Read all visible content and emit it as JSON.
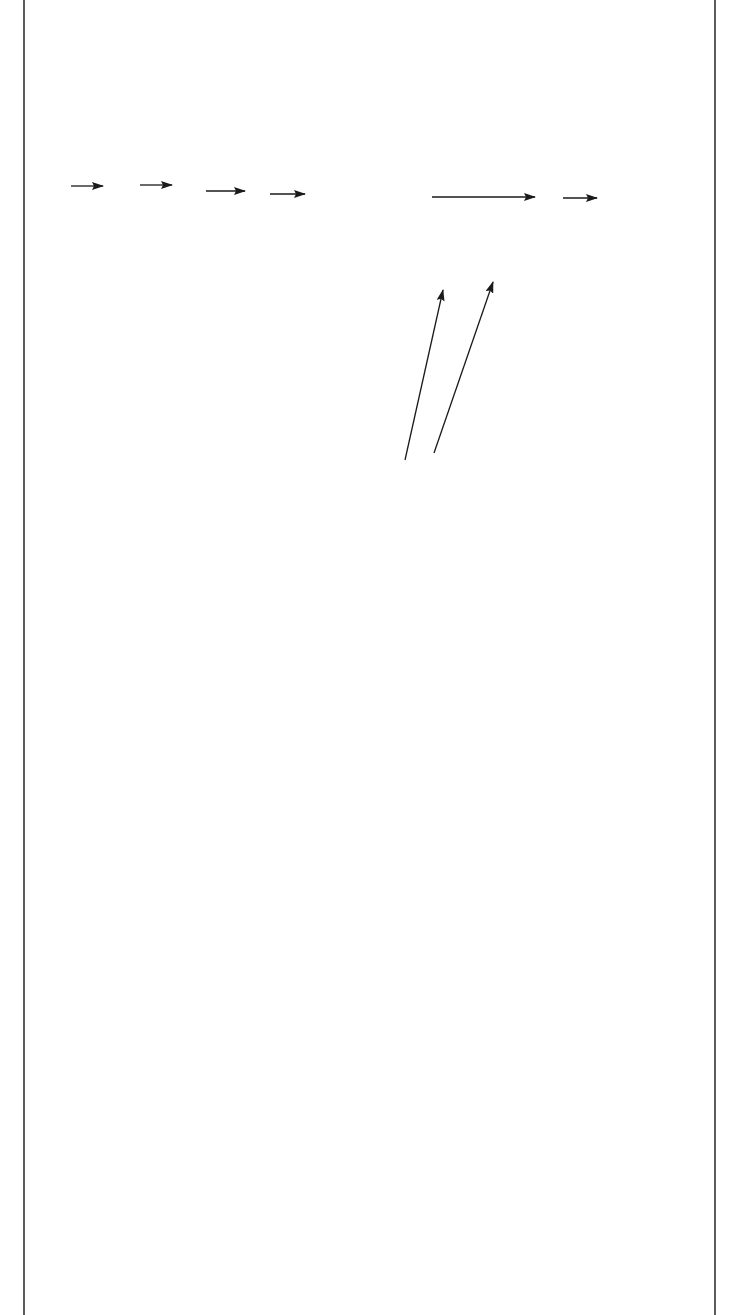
{
  "diagram": {
    "type": "flowchart",
    "orientation": "rotated-90-ccw",
    "nodes": {
      "national_party_congress": "National Party Congress",
      "party_chairman": "Party Chairman",
      "central_standing_committee": "Central Standing Committee",
      "central_committee": "Central Committee",
      "work_committees": "Work Committees",
      "work_committees_detail_1": "(Organization, Culture, Society, Youth, Mainland Affairs,",
      "work_committees_detail_2": "Overseas Chinese, Women’s Affairs, Training)",
      "general_secretary_office": "General Secretary’s Office",
      "party_policy_committee": "Party Policy Committee",
      "national_assembly": "National Assembly",
      "control_legislative_yuans": "Control and Legislative Yuans",
      "provincial_orgs": "Provincial and Special Municipality Organizations",
      "county_city_orgs": "County/City Organizations",
      "district_organs": "District Organs",
      "branch_organs": "Branch Organs",
      "cell_units": "Cell Units",
      "presidents_office": "President’s Office",
      "presidents_office_detail": "(Judicial, Executive, and Examination Yuans)"
    },
    "edges": [
      {
        "from": "National Party Congress",
        "to": "Party Chairman"
      },
      {
        "from": "Party Chairman",
        "to": "Central Standing Committee"
      },
      {
        "from": "Central Standing Committee",
        "to": "Central Committee"
      },
      {
        "from": "Central Committee",
        "to": "Work Committees"
      },
      {
        "from": "Work Committees / Party Policy Committee",
        "to": "Provincial and Special Municipality Organizations"
      },
      {
        "from": "Provincial and Special Municipality Organizations",
        "to": "County/City Organizations"
      },
      {
        "from": "Work Committees",
        "to": "National Assembly"
      },
      {
        "from": "Work Committees",
        "to": "Control and Legislative Yuans"
      },
      {
        "from": "Party Chairman",
        "to": "President’s Office"
      }
    ],
    "colors": {
      "ink": "#1a1a1a",
      "background": "#ffffff"
    }
  }
}
